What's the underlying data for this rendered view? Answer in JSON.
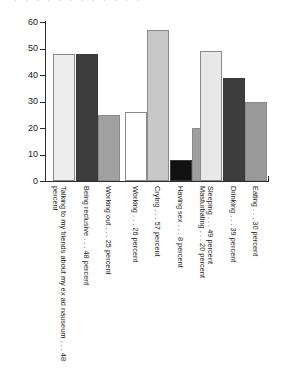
{
  "title_sliver": ". . . . . . . . . . . .",
  "axis": {
    "y_ticks": [
      "0",
      "10",
      "20",
      "30",
      "40",
      "50",
      "60"
    ]
  },
  "chart_data": {
    "type": "bar",
    "title": "",
    "xlabel": "",
    "ylabel": "",
    "ylim": [
      0,
      60
    ],
    "ytick_step": 10,
    "grid": false,
    "legend": "none",
    "value_unit": "percent",
    "categories": [
      "Talking to my friends about my ex ad nauseum",
      "Being reclusive",
      "Working out",
      "Working",
      "Crying",
      "Having sex",
      "Masturbating",
      "Sleeping",
      "Drinking",
      "Eating"
    ],
    "values": [
      48,
      48,
      25,
      26,
      57,
      8,
      20,
      49,
      39,
      30
    ],
    "tick_labels": [
      "Talking to my friends about my ex ad nauseum . . . 48 percent",
      "Being reclusive . . . 48 percent",
      "Working out . . . 25 percent",
      "Working . . . 26 percent",
      "Crying . . . 57 percent",
      "Having sex . . . 8 percent",
      "Masturbating . . . 20 percent",
      "Sleeping . . . 49 percent",
      "Drinking . . . 39 percent",
      "Eating . . . 30 percent"
    ],
    "bar_colors": [
      "#ededed",
      "#3d3d3d",
      "#a0a0a0",
      "#ffffff",
      "#c7c7c7",
      "#111111",
      "#9e9e9e",
      "#e8e8e8",
      "#3d3d3d",
      "#9a9a9a"
    ]
  },
  "layout": {
    "bar_left_px": [
      53,
      76,
      98,
      125,
      147,
      170,
      192,
      200,
      223,
      245
    ],
    "bar_width_px": [
      22,
      22,
      22,
      22,
      22,
      22,
      22,
      22,
      22,
      22
    ]
  }
}
